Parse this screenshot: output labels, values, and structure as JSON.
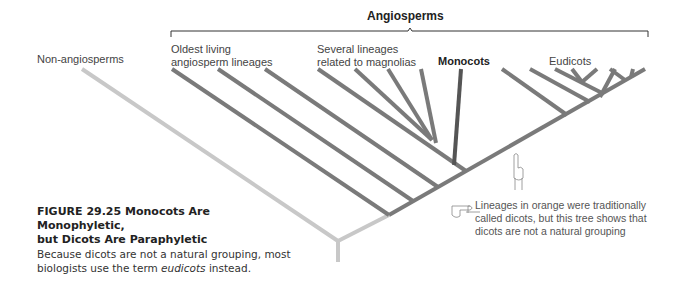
{
  "figure": {
    "group_label": "Angiosperms",
    "labels": {
      "non_angiosperms": "Non-angiosperms",
      "oldest_line1": "Oldest living",
      "oldest_line2": "angiosperm lineages",
      "magnolias_line1": "Several lineages",
      "magnolias_line2": "related to magnolias",
      "monocots": "Monocots",
      "eudicots": "Eudicots"
    },
    "note": {
      "line1": "Lineages in orange were traditionally",
      "line2": "called dicots, but this tree shows that",
      "line3": "dicots are not a natural grouping"
    },
    "icons": [
      "pointing-up-hand-icon",
      "pointing-left-hand-icon"
    ],
    "colors": {
      "non_angiosperm_branch": "#c8c8c8",
      "dicot_branch": "#7a7a7a",
      "monocot_branch": "#555555",
      "bracket": "#333333"
    }
  },
  "caption": {
    "title_line1": "FIGURE 29.25  Monocots Are Monophyletic,",
    "title_line2": "but Dicots Are Paraphyletic",
    "body_line1": "Because dicots are not a natural grouping, most",
    "body_line2_pre": "biologists use the term ",
    "body_line2_em": "eudicots",
    "body_line2_post": " instead."
  }
}
